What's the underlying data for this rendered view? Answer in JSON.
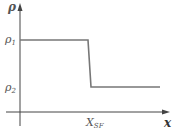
{
  "diagram": {
    "y_axis_label": "ρ",
    "x_axis_label": "x",
    "levels": [
      {
        "symbol": "ρ",
        "subscript": "1"
      },
      {
        "symbol": "ρ",
        "subscript": "2"
      }
    ],
    "x_marker": {
      "symbol": "X",
      "subscript": "SF"
    },
    "colors": {
      "axis": "#444444",
      "curve": "#777777",
      "label": "#555555"
    }
  }
}
